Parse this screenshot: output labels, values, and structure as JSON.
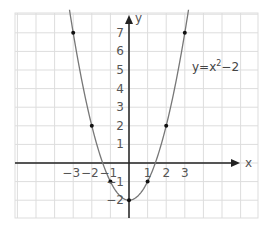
{
  "chart_data": {
    "type": "line",
    "title": "",
    "xlabel": "x",
    "ylabel": "y",
    "xlim": [
      -6,
      7
    ],
    "ylim": [
      -3,
      8
    ],
    "grid": true,
    "equation": {
      "base": "y=x",
      "exponent": "2",
      "tail": "−2",
      "placement": "top-right"
    },
    "x_ticks": [
      {
        "value": -3,
        "label": "−3"
      },
      {
        "value": -2,
        "label": "−2"
      },
      {
        "value": -1,
        "label": "−1"
      },
      {
        "value": 1,
        "label": "1"
      },
      {
        "value": 2,
        "label": "2"
      },
      {
        "value": 3,
        "label": "3"
      }
    ],
    "y_ticks": [
      {
        "value": 7,
        "label": "7"
      },
      {
        "value": 6,
        "label": "6"
      },
      {
        "value": 5,
        "label": "5"
      },
      {
        "value": 4,
        "label": "4"
      },
      {
        "value": 3,
        "label": "3"
      },
      {
        "value": 2,
        "label": "2"
      },
      {
        "value": 1,
        "label": "1"
      },
      {
        "value": -1,
        "label": "−1"
      },
      {
        "value": -2,
        "label": "−2"
      }
    ],
    "series": [
      {
        "name": "y=x^2-2",
        "function": "x^2-2",
        "domain": [
          -3.2,
          3.2
        ],
        "color": "#777777"
      }
    ],
    "points": [
      {
        "x": -3,
        "y": 7
      },
      {
        "x": -2,
        "y": 2
      },
      {
        "x": -1,
        "y": -1
      },
      {
        "x": 0,
        "y": -2
      },
      {
        "x": 1,
        "y": -1
      },
      {
        "x": 2,
        "y": 2
      },
      {
        "x": 3,
        "y": 7
      }
    ],
    "colors": {
      "grid": "#dddddd",
      "axis": "#222222",
      "curve": "#777777",
      "point": "#111111"
    }
  }
}
